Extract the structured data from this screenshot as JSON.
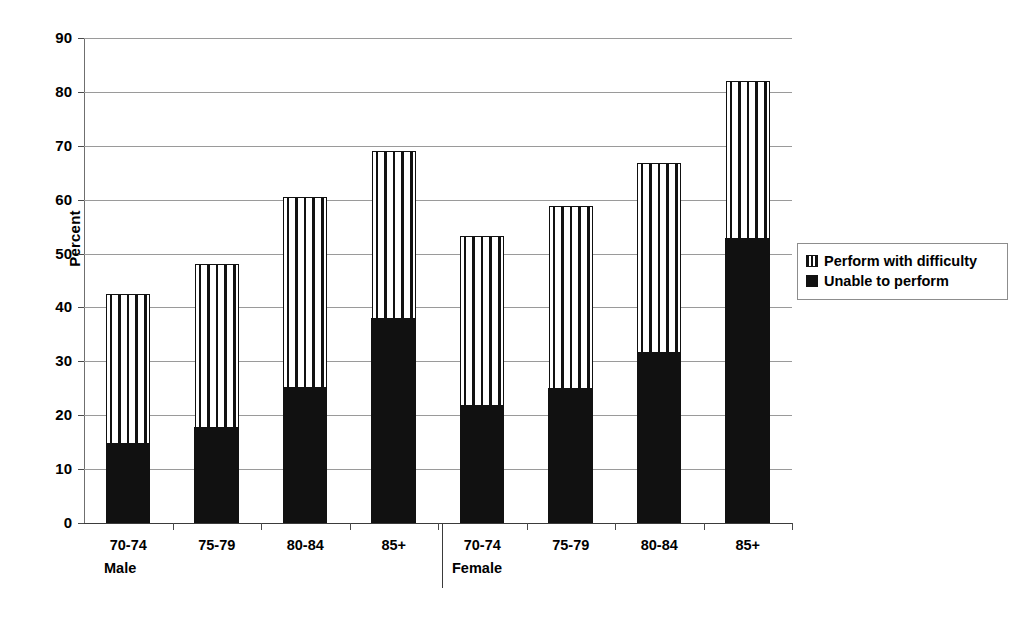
{
  "chart_data": {
    "type": "bar",
    "subtype": "stacked-bar",
    "title": "",
    "xlabel": "",
    "ylabel": "Percent",
    "ylim": [
      0,
      90
    ],
    "ytick_step": 10,
    "yticks": [
      90,
      80,
      70,
      60,
      50,
      40,
      30,
      20,
      10,
      0
    ],
    "grid": true,
    "legend_position": "right",
    "categories": [
      "70-74",
      "75-79",
      "80-84",
      "85+",
      "70-74",
      "75-79",
      "80-84",
      "85+"
    ],
    "groups": [
      {
        "label": "Male",
        "categories": [
          "70-74",
          "75-79",
          "80-84",
          "85+"
        ]
      },
      {
        "label": "Female",
        "categories": [
          "70-74",
          "75-79",
          "80-84",
          "85+"
        ]
      }
    ],
    "series": [
      {
        "name": "Unable to perform",
        "fill": "solid-black",
        "color": "#111111",
        "values": [
          15.0,
          17.8,
          25.3,
          38.2,
          22.0,
          25.2,
          31.8,
          53.0
        ]
      },
      {
        "name": "Perform with difficulty",
        "fill": "vertical-stripes",
        "color": "#ffffff",
        "values": [
          27.5,
          30.2,
          35.2,
          30.8,
          31.3,
          33.6,
          35.0,
          29.0
        ]
      }
    ],
    "totals": [
      42.5,
      48.0,
      60.5,
      69.0,
      53.3,
      58.8,
      66.8,
      82.0
    ]
  },
  "axis": {
    "y_title": "Percent",
    "y_ticks": [
      "90",
      "80",
      "70",
      "60",
      "50",
      "40",
      "30",
      "20",
      "10",
      "0"
    ]
  },
  "categories": [
    {
      "label": "70-74",
      "group": "Male"
    },
    {
      "label": "75-79",
      "group": "Male"
    },
    {
      "label": "80-84",
      "group": "Male"
    },
    {
      "label": "85+",
      "group": "Male"
    },
    {
      "label": "70-74",
      "group": "Female"
    },
    {
      "label": "75-79",
      "group": "Female"
    },
    {
      "label": "80-84",
      "group": "Female"
    },
    {
      "label": "85+",
      "group": "Female"
    }
  ],
  "group_labels": {
    "male": "Male",
    "female": "Female"
  },
  "legend": {
    "items": [
      {
        "label": "Perform with difficulty",
        "swatch": "striped-square-icon"
      },
      {
        "label": "Unable to perform",
        "swatch": "solid-square-icon"
      }
    ]
  }
}
